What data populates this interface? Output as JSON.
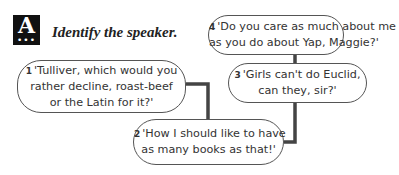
{
  "header": {
    "section_letter": "A",
    "section_dots": "•••",
    "instruction": "Identify the speaker."
  },
  "quotes": [
    {
      "number": "1",
      "lines": [
        "'Tulliver, which would you",
        "rather decline, roast-beef",
        "or the Latin for it?'"
      ]
    },
    {
      "number": "2",
      "lines": [
        "'How I should like to have",
        "as many books as that!'"
      ]
    },
    {
      "number": "3",
      "lines": [
        "'Girls can't do Euclid,",
        "can they, sir?'"
      ]
    },
    {
      "number": "4",
      "lines": [
        "'Do you care as much about me",
        "as you do about Yap, Maggie?'"
      ]
    }
  ],
  "colors": {
    "connector": "#444444",
    "bubble_border": "#555555",
    "icon_bg": "#111111"
  }
}
